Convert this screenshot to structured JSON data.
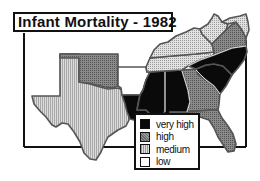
{
  "title": "Infant Mortality - 1982",
  "legend": {
    "items": [
      {
        "key": "very_high",
        "label": "very high",
        "fill": "url(#pat-vhigh)"
      },
      {
        "key": "high",
        "label": "high",
        "fill": "url(#pat-high)"
      },
      {
        "key": "medium",
        "label": "medium",
        "fill": "url(#pat-medium)"
      },
      {
        "key": "low",
        "label": "low",
        "fill": "#ffffff"
      }
    ]
  },
  "colors": {
    "very_high": "#0a0a0a",
    "high": "#7a7a7a",
    "medium": "#c4c4c4",
    "low": "#ffffff",
    "border": "#555555"
  },
  "regions": [
    {
      "name": "Texas",
      "category": "medium"
    },
    {
      "name": "Oklahoma",
      "category": "high"
    },
    {
      "name": "Arkansas",
      "category": "low"
    },
    {
      "name": "Louisiana",
      "category": "very_high"
    },
    {
      "name": "Mississippi",
      "category": "very_high"
    },
    {
      "name": "Alabama",
      "category": "very_high"
    },
    {
      "name": "Georgia",
      "category": "high"
    },
    {
      "name": "Florida",
      "category": "high"
    },
    {
      "name": "South Carolina",
      "category": "very_high"
    },
    {
      "name": "North Carolina",
      "category": "very_high"
    },
    {
      "name": "Tennessee",
      "category": "medium"
    },
    {
      "name": "Kentucky",
      "category": "medium"
    },
    {
      "name": "Virginia",
      "category": "high"
    },
    {
      "name": "West Virginia",
      "category": "medium"
    },
    {
      "name": "Maryland",
      "category": "medium"
    }
  ]
}
